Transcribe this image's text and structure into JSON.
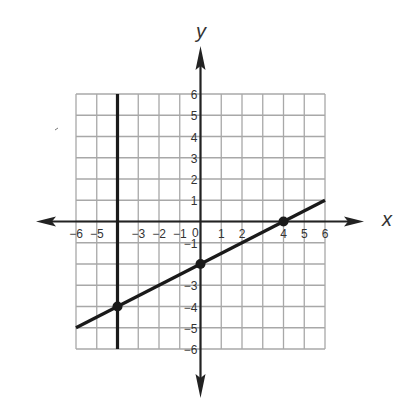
{
  "chart_data": {
    "type": "line",
    "title": "",
    "xlabel": "x",
    "ylabel": "y",
    "xlim": [
      -6,
      6
    ],
    "ylim": [
      -6,
      6
    ],
    "grid": true,
    "x_ticks": [
      -6,
      -5,
      -3,
      -2,
      -1,
      0,
      1,
      2,
      4,
      5,
      6
    ],
    "y_ticks": [
      6,
      5,
      4,
      3,
      2,
      1,
      -1,
      -3,
      -4,
      -5,
      -6
    ],
    "series": [
      {
        "name": "vertical line x = -4",
        "equation": "x = -4",
        "points": [
          [
            -4,
            6
          ],
          [
            -4,
            -6
          ]
        ]
      },
      {
        "name": "slanted line y = 0.5x - 2",
        "equation": "y = 0.5x - 2",
        "points": [
          [
            -6,
            -5
          ],
          [
            6,
            1
          ]
        ]
      }
    ],
    "marked_points": [
      {
        "x": -4,
        "y": -4
      },
      {
        "x": 0,
        "y": -2
      },
      {
        "x": 4,
        "y": 0
      }
    ]
  },
  "labels": {
    "x_axis": "x",
    "y_axis": "y",
    "origin": "0"
  },
  "colors": {
    "grid": "#a8a8a8",
    "axis": "#222222",
    "line": "#1a1a1a",
    "text": "#333333"
  }
}
